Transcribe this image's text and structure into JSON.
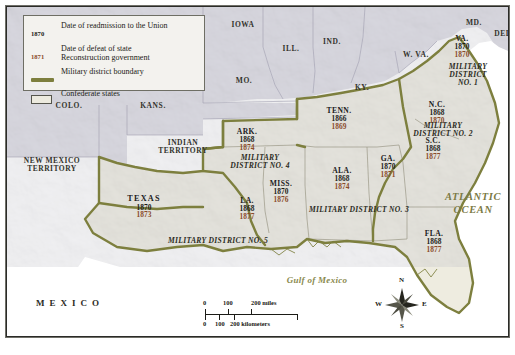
{
  "map": {
    "title_none": "",
    "legend": {
      "entries": [
        {
          "key": "1870",
          "key_type": "date-readmission",
          "text": "Date of readmission to the Union"
        },
        {
          "key": "1871",
          "key_type": "date-defeat",
          "text": "Date of defeat of state\nReconstruction government"
        },
        {
          "key": "",
          "key_type": "boundary-line",
          "text": "Military district boundary"
        },
        {
          "key": "",
          "key_type": "confederate-swatch",
          "text": "Confederate states"
        }
      ]
    },
    "colors": {
      "district_boundary": "#7d7f3e",
      "confederate_fill": "#eceade",
      "union_fill": "#dddce4",
      "ocean_text": "#7b7a44",
      "defeat_date_text": "#8a4b2a",
      "readmission_date_text": "#1c1c18",
      "frame": "#2b2b28"
    },
    "non_confederate_labels": [
      {
        "name": "IOWA",
        "x": 236,
        "y": 18
      },
      {
        "name": "ILL.",
        "x": 284,
        "y": 42
      },
      {
        "name": "IND.",
        "x": 325,
        "y": 35
      },
      {
        "name": "MO.",
        "x": 237,
        "y": 74
      },
      {
        "name": "KY.",
        "x": 355,
        "y": 81
      },
      {
        "name": "W. VA.",
        "x": 409,
        "y": 48
      },
      {
        "name": "MD.",
        "x": 467,
        "y": 16
      },
      {
        "name": "DEL.",
        "x": 497,
        "y": 27
      },
      {
        "name": "COLO.",
        "x": 62,
        "y": 99
      },
      {
        "name": "KANS.",
        "x": 146,
        "y": 99
      }
    ],
    "territory_labels": [
      {
        "name": "INDIAN\nTERRITORY",
        "x": 176,
        "y": 140
      },
      {
        "name": "NEW MEXICO\nTERRITORY",
        "x": 45,
        "y": 158
      }
    ],
    "confederate_states": [
      {
        "abbr": "VA.",
        "readmitted": "1870",
        "defeated": "1870",
        "x": 455,
        "y": 40
      },
      {
        "abbr": "N.C.",
        "readmitted": "1868",
        "defeated": "1870",
        "x": 430,
        "y": 106
      },
      {
        "abbr": "S.C.",
        "readmitted": "1868",
        "defeated": "1877",
        "x": 426,
        "y": 142
      },
      {
        "abbr": "GA.",
        "readmitted": "1870",
        "defeated": "1871",
        "x": 381,
        "y": 160
      },
      {
        "abbr": "FLA.",
        "readmitted": "1868",
        "defeated": "1877",
        "x": 427,
        "y": 235
      },
      {
        "abbr": "ALA.",
        "readmitted": "1868",
        "defeated": "1874",
        "x": 335,
        "y": 172
      },
      {
        "abbr": "MISS.",
        "readmitted": "1870",
        "defeated": "1876",
        "x": 274,
        "y": 185
      },
      {
        "abbr": "TENN.",
        "readmitted": "1866",
        "defeated": "1869",
        "x": 332,
        "y": 112
      },
      {
        "abbr": "ARK.",
        "readmitted": "1868",
        "defeated": "1874",
        "x": 240,
        "y": 133
      },
      {
        "abbr": "LA.",
        "readmitted": "1868",
        "defeated": "1877",
        "x": 240,
        "y": 202
      },
      {
        "abbr": "TEXAS",
        "readmitted": "1870",
        "defeated": "1873",
        "x": 137,
        "y": 200
      }
    ],
    "military_districts": [
      {
        "label": "MILITARY\nDISTRICT NO. 1",
        "x": 461,
        "y": 68
      },
      {
        "label": "MILITARY\nDISTRICT NO. 2",
        "x": 436,
        "y": 123
      },
      {
        "label": "MILITARY DISTRICT NO. 3",
        "x": 352,
        "y": 203
      },
      {
        "label": "MILITARY\nDISTRICT NO. 4",
        "x": 253,
        "y": 155
      },
      {
        "label": "MILITARY DISTRICT NO. 5",
        "x": 211,
        "y": 234
      }
    ],
    "water_labels": [
      {
        "name": "ATLANTIC\nOCEAN",
        "x": 466,
        "y": 196
      },
      {
        "name": "Gulf of Mexico",
        "x": 310,
        "y": 274
      }
    ],
    "country_labels": [
      {
        "name": "MEXICO",
        "x": 63,
        "y": 297
      }
    ],
    "scale_bar": {
      "miles": {
        "ticks": [
          "0",
          "100",
          "200"
        ],
        "unit": "200 miles",
        "labels": [
          "0",
          "100"
        ]
      },
      "kilometers": {
        "labels": [
          "0",
          "100",
          "200"
        ],
        "unit": "200 kilometers"
      },
      "miles_0": "0",
      "miles_100": "100",
      "miles_200_unit": "200 miles",
      "km_0": "0",
      "km_100": "100",
      "km_200_unit": "200 kilometers"
    },
    "compass": {
      "north": "N",
      "south": "S",
      "east": "E",
      "west": "W"
    }
  }
}
